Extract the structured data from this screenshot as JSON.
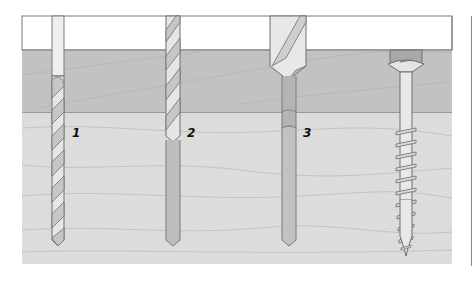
{
  "diagram": {
    "layers": [
      {
        "name": "top-board",
        "color": "#ffffff"
      },
      {
        "name": "middle-board",
        "color": "#c2c2c2"
      },
      {
        "name": "bottom-board",
        "color": "#dcdcdc"
      }
    ],
    "colors": {
      "outline": "#6e6e6e",
      "grain": "#b5b5b5",
      "drill_light": "#ececec",
      "drill_mid": "#c8c8c8",
      "drill_dark": "#a8a8a8",
      "hole": "#bdbdbd"
    },
    "steps": [
      {
        "label": "1",
        "description": "pilot drill bit"
      },
      {
        "label": "2",
        "description": "clearance drill bit"
      },
      {
        "label": "3",
        "description": "countersink bit"
      },
      {
        "label": "",
        "description": "countersunk screw installed"
      }
    ]
  }
}
